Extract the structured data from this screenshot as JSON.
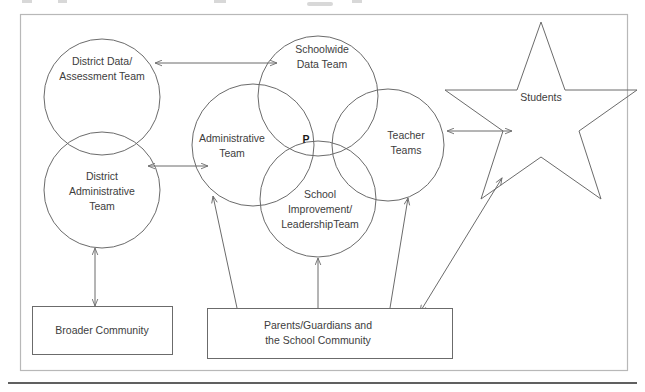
{
  "page": {
    "background_color": "#ffffff",
    "frame_color": "#b8b8b8",
    "line_color": "#6b6b6b",
    "text_color": "#3d3d3d"
  },
  "diagram": {
    "type": "venn-relationship-diagram",
    "circles": [
      {
        "id": "district-data-assessment-team",
        "label_lines": [
          "District Data/",
          "Assessment Team"
        ],
        "cx": 102,
        "cy": 97,
        "r": 58
      },
      {
        "id": "district-administrative-team",
        "label_lines": [
          "District",
          "Administrative",
          "Team"
        ],
        "cx": 102,
        "cy": 190,
        "r": 58
      },
      {
        "id": "administrative-team",
        "label_lines": [
          "Administrative",
          "Team"
        ],
        "cx": 253,
        "cy": 145,
        "r": 61
      },
      {
        "id": "schoolwide-data-team",
        "label_lines": [
          "Schoolwide",
          "Data Team"
        ],
        "cx": 318,
        "cy": 96,
        "r": 60
      },
      {
        "id": "teacher-teams",
        "label_lines": [
          "Teacher",
          "Teams"
        ],
        "cx": 388,
        "cy": 145,
        "r": 56
      },
      {
        "id": "school-improvement-leadership-team",
        "label_lines": [
          "School",
          "Improvement/",
          "LeadershipTeam"
        ],
        "cx": 318,
        "cy": 199,
        "r": 58
      }
    ],
    "center_marker": {
      "id": "center-p-marker",
      "label": "P",
      "x": 306,
      "y": 140
    },
    "star": {
      "id": "students-star",
      "label": "Students",
      "label_x": 541,
      "label_y": 98,
      "cx": 541,
      "cy": 110,
      "outer_r": 90,
      "inner_r": 37
    },
    "boxes": [
      {
        "id": "broader-community-box",
        "label_lines": [
          "Broader Community"
        ],
        "x": 32,
        "y": 306,
        "width": 140,
        "height": 48
      },
      {
        "id": "parents-guardians-school-community-box",
        "label_lines": [
          "Parents/Guardians and",
          "the School Community"
        ],
        "x": 207,
        "y": 308,
        "width": 245,
        "height": 50
      }
    ],
    "connectors": [
      {
        "id": "district-data-to-schoolwide-data",
        "from": "district-data-assessment-team",
        "to": "schoolwide-data-team",
        "arrow": "double"
      },
      {
        "id": "district-admin-to-administrative",
        "from": "district-administrative-team",
        "to": "administrative-team",
        "arrow": "double"
      },
      {
        "id": "teacher-teams-to-students",
        "from": "teacher-teams",
        "to": "students-star",
        "arrow": "double"
      },
      {
        "id": "broader-community-to-district-admin",
        "from": "broader-community-box",
        "to": "district-administrative-team",
        "arrow": "double"
      },
      {
        "id": "parents-to-administrative-team",
        "from": "parents-guardians-school-community-box",
        "to": "administrative-team",
        "arrow": "single"
      },
      {
        "id": "parents-to-school-improvement",
        "from": "parents-guardians-school-community-box",
        "to": "school-improvement-leadership-team",
        "arrow": "single"
      },
      {
        "id": "parents-to-teacher-teams",
        "from": "parents-guardians-school-community-box",
        "to": "teacher-teams",
        "arrow": "single"
      },
      {
        "id": "parents-to-students",
        "from": "parents-guardians-school-community-box",
        "to": "students-star",
        "arrow": "double"
      }
    ]
  }
}
